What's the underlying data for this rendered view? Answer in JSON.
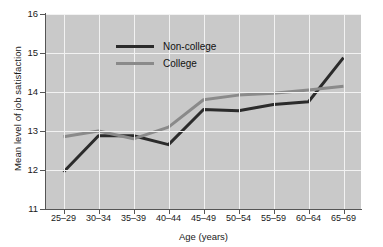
{
  "chart_data": {
    "type": "line",
    "title": "",
    "xlabel": "Age (years)",
    "ylabel": "Mean level of job satisfaction",
    "categories": [
      "25–29",
      "30–34",
      "35–39",
      "40–44",
      "45–49",
      "50–54",
      "55–59",
      "60–64",
      "65–69"
    ],
    "ylim": [
      11,
      16
    ],
    "yticks": [
      11,
      12,
      13,
      14,
      15,
      16
    ],
    "ytick_labels": [
      "11",
      "12",
      "13",
      "14",
      "15",
      "16"
    ],
    "grid": true,
    "legend_position": "upper-left-inside",
    "series": [
      {
        "name": "Non-college",
        "color": "#2b2b2b",
        "values": [
          11.95,
          12.88,
          12.88,
          12.65,
          13.55,
          13.52,
          13.68,
          13.75,
          14.88
        ]
      },
      {
        "name": "College",
        "color": "#8a8a8a",
        "values": [
          12.85,
          13.0,
          12.8,
          13.1,
          13.8,
          13.92,
          13.97,
          14.05,
          14.15
        ]
      }
    ]
  },
  "colors": {
    "plot_background": "#c9c9c9",
    "gridline": "#f2f2f2",
    "axis": "#555555",
    "non_college": "#2b2b2b",
    "college": "#8a8a8a",
    "text": "#1a1a1a"
  }
}
